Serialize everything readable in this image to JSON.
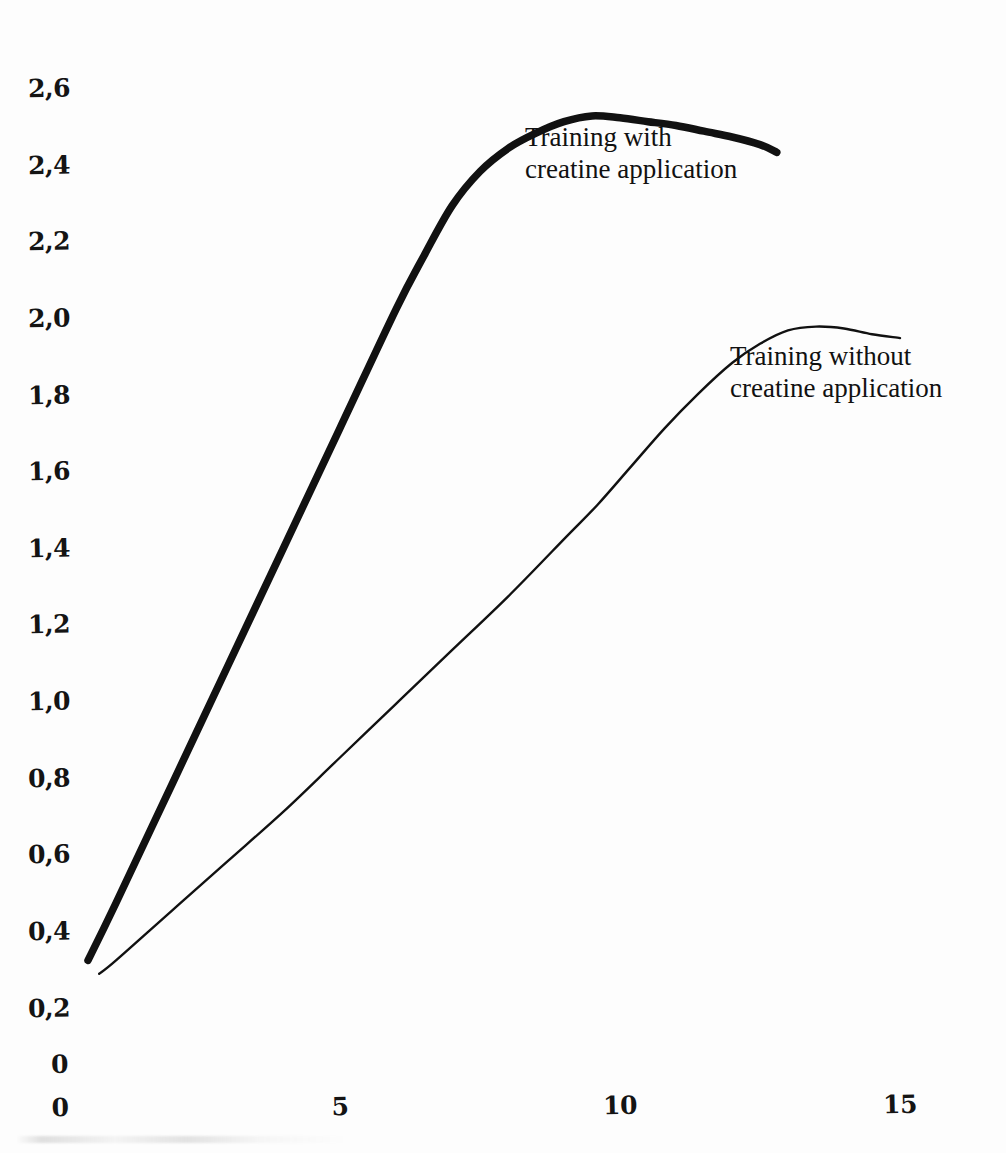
{
  "figure": {
    "background_color": "#fdfdfd",
    "ink_color": "#111111"
  },
  "chart_data": {
    "type": "line",
    "title": "",
    "subtitle": "",
    "xlabel": "",
    "ylabel": "",
    "xlim": [
      0,
      16.3
    ],
    "ylim": [
      0,
      2.7
    ],
    "grid": false,
    "legend_position": "inline-annotation",
    "x_ticks": [
      0,
      5,
      10,
      15
    ],
    "x_tick_labels": [
      "0",
      "5",
      "10",
      "15"
    ],
    "x_minor_tick_step": 1,
    "y_ticks": [
      0,
      0.2,
      0.4,
      0.6,
      0.8,
      1.0,
      1.2,
      1.4,
      1.6,
      1.8,
      2.0,
      2.2,
      2.4,
      2.6
    ],
    "y_tick_labels": [
      "0",
      "0,2",
      "0,4",
      "0,6",
      "0,8",
      "1,0",
      "1,2",
      "1,4",
      "1,6",
      "1,8",
      "2,0",
      "2,2",
      "2,4",
      "2,6"
    ],
    "series": [
      {
        "name": "Training with creatine application",
        "label_line1": "Training with",
        "label_line2": "creatine application",
        "line_weight": "thick",
        "color": "#111111",
        "x": [
          0.5,
          1,
          2,
          3,
          4,
          5,
          6,
          6.5,
          7,
          7.5,
          8,
          8.5,
          9,
          9.5,
          10,
          10.5,
          11,
          11.5,
          12,
          12.5,
          12.8
        ],
        "y": [
          0.32,
          0.47,
          0.78,
          1.09,
          1.4,
          1.71,
          2.02,
          2.16,
          2.29,
          2.38,
          2.44,
          2.48,
          2.51,
          2.525,
          2.52,
          2.51,
          2.5,
          2.485,
          2.47,
          2.45,
          2.43
        ]
      },
      {
        "name": "Training without creatine application",
        "label_line1": "Training without",
        "label_line2": "creatine application",
        "line_weight": "thin",
        "color": "#111111",
        "x": [
          0.7,
          1,
          2,
          3,
          4,
          5,
          6,
          7,
          8,
          9,
          9.6,
          10.2,
          10.8,
          11.4,
          12,
          12.5,
          13,
          13.5,
          14,
          14.5,
          15
        ],
        "y": [
          0.285,
          0.32,
          0.45,
          0.58,
          0.71,
          0.85,
          0.99,
          1.13,
          1.27,
          1.42,
          1.51,
          1.61,
          1.71,
          1.8,
          1.88,
          1.93,
          1.965,
          1.975,
          1.97,
          1.955,
          1.945
        ]
      }
    ]
  },
  "annotations": {
    "series_with": {
      "line1": "Training with",
      "line2": "creatine application"
    },
    "series_without": {
      "line1": "Training without",
      "line2": "creatine application"
    }
  },
  "axes": {
    "origin_label": "0",
    "y_axis_name": "y-axis",
    "x_axis_name": "x-axis"
  }
}
